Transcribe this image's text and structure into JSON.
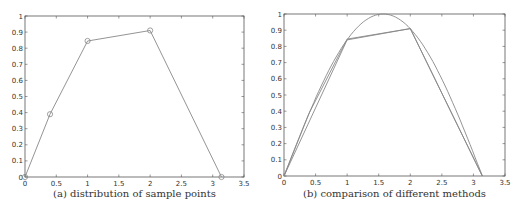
{
  "chart_data": [
    {
      "type": "line",
      "caption": "(a) distribution of sample points",
      "xlabel": "",
      "ylabel": "",
      "xlim": [
        0,
        3.5
      ],
      "ylim": [
        0,
        1
      ],
      "xticks": [
        "0",
        "0.5",
        "1",
        "1.5",
        "2",
        "2.5",
        "3",
        "3.5"
      ],
      "yticks": [
        "0",
        "0.1",
        "0.2",
        "0.3",
        "0.4",
        "0.5",
        "0.6",
        "0.7",
        "0.8",
        "0.9",
        "1"
      ],
      "grid": false,
      "series": [
        {
          "name": "sample points",
          "markers": "circle",
          "x": [
            0,
            0.4,
            1,
            2,
            3.14
          ],
          "y": [
            0,
            0.39,
            0.845,
            0.91,
            0
          ]
        }
      ]
    },
    {
      "type": "line",
      "caption": "(b) comparison of different methods",
      "xlabel": "",
      "ylabel": "",
      "xlim": [
        0,
        3.5
      ],
      "ylim": [
        0,
        1
      ],
      "xticks": [
        "0",
        "0.5",
        "1",
        "1.5",
        "2",
        "2.5",
        "3",
        "3.5"
      ],
      "yticks": [
        "0",
        "0.1",
        "0.2",
        "0.3",
        "0.4",
        "0.5",
        "0.6",
        "0.7",
        "0.8",
        "0.9",
        "1"
      ],
      "grid": false,
      "series": [
        {
          "name": "sin(x)",
          "function": "sin",
          "domain": [
            0,
            3.1416
          ]
        },
        {
          "name": "piecewise linear",
          "x": [
            0,
            0.4,
            1,
            2,
            3.14
          ],
          "y": [
            0,
            0.39,
            0.845,
            0.91,
            0
          ]
        },
        {
          "name": "secondary approximation",
          "x": [
            0,
            1,
            2,
            3.14
          ],
          "y": [
            0,
            0.84,
            0.91,
            0
          ]
        }
      ]
    }
  ]
}
